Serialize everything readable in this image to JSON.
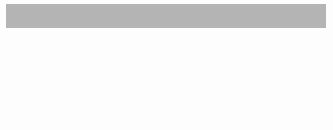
{
  "header": {
    "bar_color": "#b4b4b4",
    "text_color": "#1a1a1a"
  },
  "canvas": {
    "width": 333,
    "height": 130,
    "background": "#fdfdfd"
  },
  "style": {
    "box_border_color": "#6b6b6b",
    "box_fill_color": "#ffffff",
    "edge_color": "#77797c"
  },
  "diagram": {
    "type": "bipartite-attention-graph",
    "fully_connected": true,
    "edge_count": 16,
    "rows": [
      {
        "name": "input-row",
        "y": 38,
        "height": 22,
        "tokens": [
          {
            "label": "I",
            "x": 7,
            "width": 63
          },
          {
            "label": "have",
            "x": 93,
            "width": 60
          },
          {
            "label": "a",
            "x": 178,
            "width": 63
          },
          {
            "label": "pen",
            "x": 262,
            "width": 64
          }
        ]
      },
      {
        "name": "output-row",
        "y": 95,
        "height": 22,
        "tokens": [
          {
            "label": "I",
            "x": 7,
            "width": 63
          },
          {
            "label": "have",
            "x": 93,
            "width": 60
          },
          {
            "label": "a",
            "x": 178,
            "width": 63
          },
          {
            "label": "pen",
            "x": 262,
            "width": 64
          }
        ]
      }
    ],
    "clipped_row": {
      "name": "clipped-bottom-row",
      "y": 126,
      "boxes": [
        {
          "x": 7,
          "width": 93
        },
        {
          "x": 106,
          "width": 134
        }
      ]
    }
  }
}
